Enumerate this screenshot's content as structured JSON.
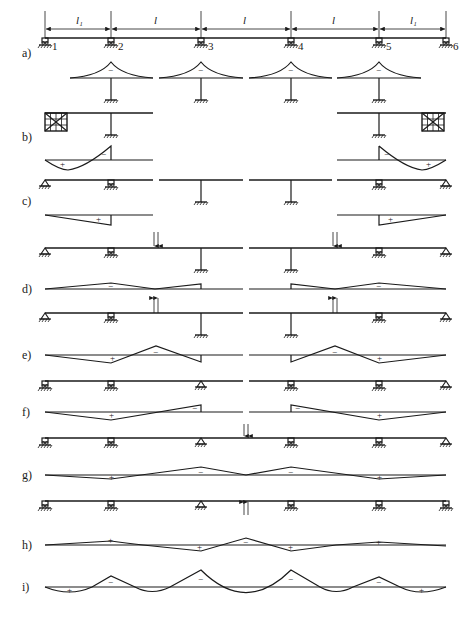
{
  "figure": {
    "span_labels": [
      "l₁",
      "l",
      "l",
      "l",
      "l₁"
    ],
    "support_numbers": [
      "1",
      "2",
      "3",
      "4",
      "5",
      "6"
    ],
    "panel_labels": [
      "a)",
      "b)",
      "c)",
      "d)",
      "e)",
      "f)",
      "g)",
      "h)",
      "i)"
    ],
    "signs": {
      "minus": "−",
      "plus": "+"
    },
    "colors": {
      "ink": "#1a1a1a",
      "background": "#ffffff"
    },
    "panels": [
      {
        "id": "a",
        "label": "a)",
        "description": "Full beam with 6 supports; local negative moment diagrams over supports 2-5 with fixed columns",
        "diagram_signs": [
          "−",
          "−",
          "−",
          "−"
        ]
      },
      {
        "id": "b",
        "label": "b)",
        "description": "End spans with rigid blocks at supports 1 and 6; moment diagrams",
        "diagram_signs": [
          "+",
          "−",
          "−",
          "+"
        ]
      },
      {
        "id": "c",
        "label": "c)",
        "description": "Simply supported end spans and column substructures; linear diagrams",
        "diagram_signs": [
          "+",
          "+"
        ]
      },
      {
        "id": "d",
        "label": "d)",
        "description": "Downward paired loads at mid-span 2-3 and 4-5",
        "diagram_signs": [
          "−",
          "−"
        ]
      },
      {
        "id": "e",
        "label": "e)",
        "description": "Upward paired loads at mid-span 2-3 and 4-5",
        "diagram_signs": [
          "+",
          "−",
          "−",
          "+"
        ]
      },
      {
        "id": "f",
        "label": "f)",
        "description": "Beam on supports 1,2,3 (hinge) and 4,5,6 (hinge)",
        "diagram_signs": [
          "+",
          "−",
          "−",
          "+"
        ]
      },
      {
        "id": "g",
        "label": "g)",
        "description": "Downward paired load at mid-span 3-4",
        "diagram_signs": [
          "+",
          "−",
          "−",
          "+"
        ]
      },
      {
        "id": "h",
        "label": "h)",
        "description": "Upward paired load at mid-span 3-4",
        "diagram_signs": [
          "+",
          "+",
          "−",
          "+",
          "+"
        ]
      },
      {
        "id": "i",
        "label": "i)",
        "description": "Final combined bending moment diagram",
        "diagram_signs": [
          "+",
          "−",
          "−",
          "−",
          "−",
          "+"
        ]
      }
    ]
  }
}
